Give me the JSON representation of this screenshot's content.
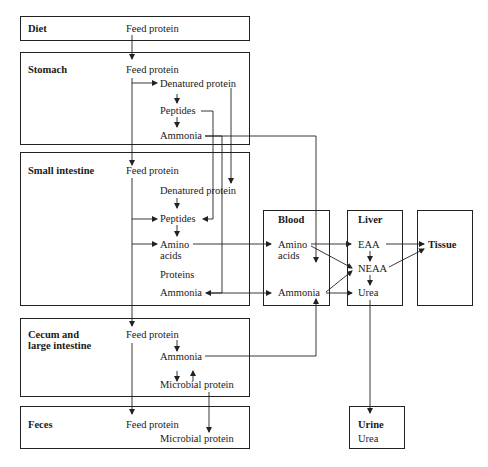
{
  "diagram": {
    "colors": {
      "line": "#222222",
      "text": "#1a1a1a",
      "background": "#ffffff"
    },
    "compartments": {
      "diet": {
        "title": "Diet",
        "items": [
          "Feed protein"
        ]
      },
      "stomach": {
        "title": "Stomach",
        "items": [
          "Feed protein",
          "Denatured protein",
          "Peptides",
          "Ammonia"
        ]
      },
      "small_intestine": {
        "title": "Small intestine",
        "items": [
          "Feed protein",
          "Denatured protein",
          "Peptides",
          "Amino",
          "acids",
          "Proteins",
          "Ammonia"
        ]
      },
      "cecum": {
        "title_line1": "Cecum and",
        "title_line2": "large intestine",
        "items": [
          "Feed protein",
          "Ammonia",
          "Microbial protein"
        ]
      },
      "feces": {
        "title": "Feces",
        "items": [
          "Feed protein",
          "Microbial protein"
        ]
      },
      "blood": {
        "title": "Blood",
        "items": [
          "Amino",
          "acids",
          "Ammonia"
        ]
      },
      "liver": {
        "title": "Liver",
        "items": [
          "EAA",
          "NEAA",
          "Urea"
        ]
      },
      "tissue": {
        "title": "Tissue"
      },
      "urine": {
        "title": "Urine",
        "items": [
          "Urea"
        ]
      }
    }
  }
}
